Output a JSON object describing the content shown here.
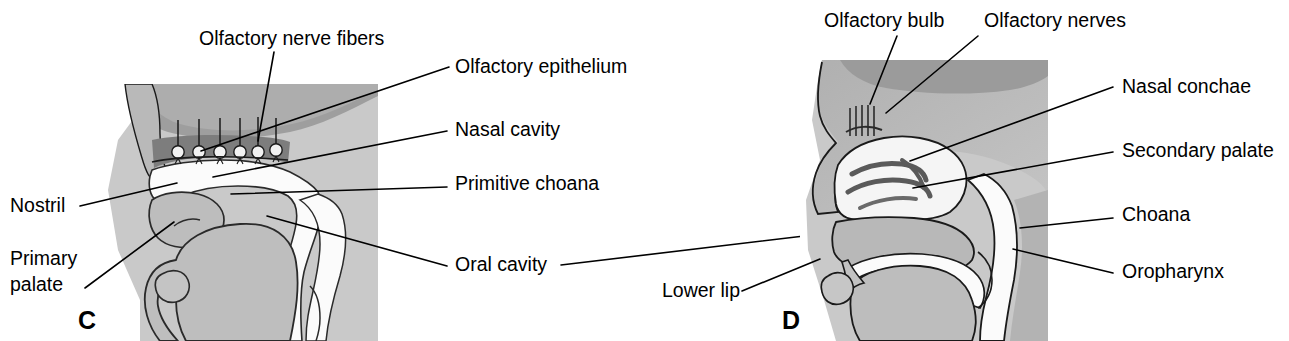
{
  "figure": {
    "type": "anatomical-diagram",
    "background_color": "#ffffff",
    "panels": [
      {
        "id": "C",
        "letter": "C",
        "letter_pos": {
          "x": 78,
          "y": 329
        },
        "plate_color": "#c9c9c9",
        "plate": {
          "x": 90,
          "y": 84,
          "width": 288,
          "height": 257
        },
        "labels": [
          {
            "name": "olfactory-nerve-fibers",
            "text": "Olfactory nerve fibers",
            "x": 199,
            "y": 45,
            "anchor": "start",
            "leader": "M 274 52 L 258 141"
          },
          {
            "name": "olfactory-epithelium",
            "text": "Olfactory epithelium",
            "x": 455,
            "y": 73,
            "anchor": "start",
            "leader": "M 449 67 L 201 151"
          },
          {
            "name": "nasal-cavity",
            "text": "Nasal cavity",
            "x": 455,
            "y": 136,
            "anchor": "start",
            "leader": "M 447 131 L 213 177"
          },
          {
            "name": "primitive-choana",
            "text": "Primitive choana",
            "x": 455,
            "y": 190,
            "anchor": "start",
            "leader": "M 447 187 L 231 194"
          },
          {
            "name": "oral-cavity",
            "text": "Oral cavity",
            "x": 455,
            "y": 271,
            "anchor": "start",
            "leader": "M 447 266 L 267 216"
          },
          {
            "name": "nostril",
            "text": "Nostril",
            "x": 10,
            "y": 212,
            "anchor": "start",
            "leader": "M 80 206 L 177 183"
          },
          {
            "name": "primary-palate",
            "text": "Primary",
            "x": 10,
            "y": 265,
            "anchor": "start",
            "leader": "M 85 288 L 174 222"
          },
          {
            "name": "primary-palate-line2",
            "text": "palate",
            "x": 10,
            "y": 291,
            "anchor": "start",
            "leader": ""
          }
        ]
      },
      {
        "id": "D",
        "letter": "D",
        "letter_pos": {
          "x": 782,
          "y": 329
        },
        "plate_color": "#c9c9c9",
        "plate": {
          "x": 800,
          "y": 60,
          "width": 248,
          "height": 281
        },
        "labels": [
          {
            "name": "olfactory-bulb",
            "text": "Olfactory bulb",
            "x": 824,
            "y": 27,
            "anchor": "start",
            "leader": "M 897 36 L 870 104"
          },
          {
            "name": "olfactory-nerves",
            "text": "Olfactory nerves",
            "x": 984,
            "y": 27,
            "anchor": "start",
            "leader": "M 978 36 L 886 113"
          },
          {
            "name": "nasal-conchae",
            "text": "Nasal conchae",
            "x": 1122,
            "y": 93,
            "anchor": "start",
            "leader": "M 1113 87 L 910 161"
          },
          {
            "name": "secondary-palate",
            "text": "Secondary palate",
            "x": 1122,
            "y": 157,
            "anchor": "start",
            "leader": "M 1113 152 L 913 188"
          },
          {
            "name": "choana",
            "text": "Choana",
            "x": 1122,
            "y": 221,
            "anchor": "start",
            "leader": "M 1113 218 L 1020 228"
          },
          {
            "name": "oropharynx",
            "text": "Oropharynx",
            "x": 1122,
            "y": 278,
            "anchor": "start",
            "leader": "M 1113 273 L 1013 249"
          },
          {
            "name": "lower-lip",
            "text": "Lower lip",
            "x": 662,
            "y": 297,
            "anchor": "start",
            "leader": "M 742 291 L 820 259"
          }
        ],
        "cross_panel_leader": "M 561 265 L 838 232"
      }
    ]
  },
  "palette": {
    "plate_grey": "#c9c9c9",
    "tissue_mid": "#b4b4b4",
    "tissue_dark": "#9a9a9a",
    "tissue_light": "#d6d6d6",
    "cavity_white": "#fbfbfb",
    "epithelium_dark": "#8c8c8c",
    "outline": "#1a1a1a",
    "text": "#000000"
  }
}
